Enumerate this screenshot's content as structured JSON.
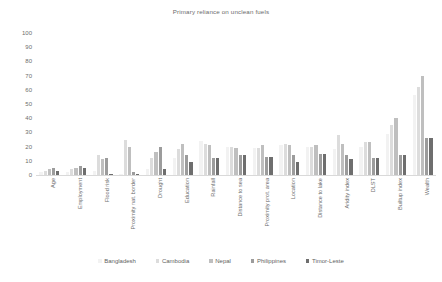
{
  "chart_data": {
    "type": "bar",
    "title": "Primary reliance on unclean fuels",
    "xlabel": "",
    "ylabel": "",
    "ylim": [
      0,
      100
    ],
    "ytick_step": 10,
    "yticks": [
      100,
      90,
      80,
      70,
      60,
      50,
      40,
      30,
      20,
      10,
      0
    ],
    "grid": false,
    "legend_position": "bottom",
    "categories": [
      "Age",
      "Employment",
      "Flood risk",
      "Proximity nat. border",
      "Drought",
      "Education",
      "Rainfall",
      "Distance to sea",
      "Proximity prot. area",
      "Location",
      "Distance to lake",
      "Aridity index",
      "DLST",
      "Builtup index",
      "Wealth"
    ],
    "series": [
      {
        "name": "Bangladesh",
        "color": "#f2f2f2",
        "values": [
          2,
          2,
          3,
          1,
          4,
          12,
          24,
          20,
          19,
          21,
          20,
          18,
          20,
          29,
          56
        ]
      },
      {
        "name": "Cambodia",
        "color": "#dcdcdc",
        "values": [
          3,
          4,
          14,
          25,
          12,
          18,
          22,
          20,
          19,
          22,
          20,
          28,
          23,
          35,
          62
        ]
      },
      {
        "name": "Nepal",
        "color": "#bfbfbf",
        "values": [
          4,
          5,
          11,
          20,
          16,
          22,
          21,
          19,
          21,
          21,
          21,
          22,
          23,
          40,
          70
        ]
      },
      {
        "name": "Philippines",
        "color": "#9c9c9c",
        "values": [
          5,
          6,
          12,
          2,
          20,
          14,
          12,
          14,
          13,
          14,
          15,
          14,
          12,
          14,
          26
        ]
      },
      {
        "name": "Timor-Leste",
        "color": "#6e6e6e",
        "values": [
          3,
          5,
          1,
          1,
          4,
          9,
          12,
          14,
          13,
          9,
          15,
          11,
          12,
          14,
          26
        ]
      }
    ]
  },
  "legend": {
    "items": [
      {
        "label": "Bangladesh",
        "color": "#f2f2f2"
      },
      {
        "label": "Cambodia",
        "color": "#dcdcdc"
      },
      {
        "label": "Nepal",
        "color": "#bfbfbf"
      },
      {
        "label": "Philippines",
        "color": "#9c9c9c"
      },
      {
        "label": "Timor-Leste",
        "color": "#6e6e6e"
      }
    ]
  }
}
